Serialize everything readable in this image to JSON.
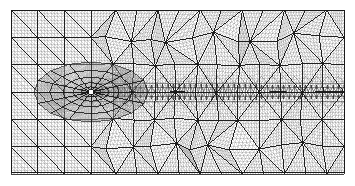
{
  "figure": {
    "title": "Adaptive triangular finite element mesh",
    "type": "mesh-plot",
    "background_color": "#ffffff",
    "line_color": "#1a1a1a",
    "fine_line_color": "#808080",
    "fill_color": "#ffffff"
  },
  "canvas": {
    "width": 355,
    "height": 186
  },
  "domain": {
    "label": "computational-domain",
    "x_min": 11,
    "y_min": 10,
    "x_max": 344,
    "y_max": 172,
    "width": 333,
    "height": 162,
    "border_color": "#1a1a1a",
    "border_width": 1.0
  },
  "mesh_data": {
    "type": "triangular-mesh",
    "element_shape": "triangle",
    "refinement": "adaptive-local",
    "macro_cell_size": 27.7,
    "macro_columns": 12,
    "macro_rows": 6,
    "subdivision_levels": 8,
    "structured_region": {
      "label": "structured-quadrant-grid",
      "x_range": [
        11,
        94
      ],
      "description": "Regular quadrilateral grid cells each split by a single diagonal into two triangles, occupying the left portion of the domain away from the centerline."
    },
    "unstructured_region": {
      "label": "unstructured-triangulation",
      "x_range": [
        94,
        344
      ],
      "description": "Irregular Delaunay-like triangulation of larger macro triangles filling the right portion of the domain."
    },
    "singularity": {
      "label": "singular-point",
      "x": 91,
      "y": 92,
      "marker": "white-square-hole",
      "marker_size": 4,
      "marker_color": "#ffffff",
      "description": "Point of maximum mesh refinement; a small square hole is left unmeshed at the centre of the radial fan."
    },
    "wake_band": {
      "label": "refined-wake-band",
      "x_start": 91,
      "x_end": 344,
      "y_center": 92,
      "half_height": 9,
      "description": "Horizontal strip of highly refined elements trailing the singular point toward the right boundary; appears near-black due to dense edge packing."
    },
    "centerline": {
      "label": "symmetry-axis",
      "y": 92,
      "description": "Horizontal line of symmetry; the mesh is mirrored about this axis."
    },
    "fan": {
      "label": "radial-fan",
      "center_x": 91,
      "center_y": 92,
      "ray_count": 16,
      "ring_count": 7,
      "outer_radius": 30,
      "description": "Graded radial fan of triangles converging geometrically toward the singular point."
    }
  }
}
